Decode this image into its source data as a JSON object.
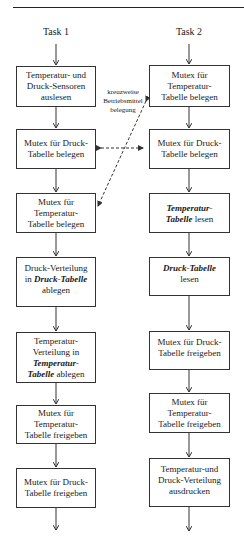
{
  "diagram": {
    "type": "flowchart",
    "columns": [
      {
        "title": "Task 1",
        "steps": [
          {
            "lines": [
              {
                "text": "Temperatur- und"
              },
              {
                "text": "Druck-Sensoren"
              },
              {
                "text": "auslesen"
              }
            ]
          },
          {
            "lines": [
              {
                "text": "Mutex für Druck-"
              },
              {
                "text": "Tabelle belegen"
              }
            ]
          },
          {
            "lines": [
              {
                "text": "Mutex für"
              },
              {
                "text": "Temperatur-"
              },
              {
                "text": "Tabelle belegen"
              }
            ]
          },
          {
            "lines": [
              {
                "text": "Druck-Verteilung"
              },
              {
                "pre": "in ",
                "em": "Druck-Tabelle"
              },
              {
                "text": "ablegen"
              }
            ]
          },
          {
            "lines": [
              {
                "text": "Temperatur-"
              },
              {
                "text": "Verteilung in"
              },
              {
                "em": "Temperatur-"
              },
              {
                "em": "Tabelle",
                "post": " ablegen"
              }
            ]
          },
          {
            "lines": [
              {
                "text": "Mutex für"
              },
              {
                "text": "Temperatur-"
              },
              {
                "text": "Tabelle freigeben"
              }
            ]
          },
          {
            "lines": [
              {
                "text": "Mutex für Druck-"
              },
              {
                "text": "Tabelle freigeben"
              }
            ]
          }
        ]
      },
      {
        "title": "Task 2",
        "steps": [
          {
            "lines": [
              {
                "text": "Mutex für"
              },
              {
                "text": "Temperatur-"
              },
              {
                "text": "Tabelle belegen"
              }
            ]
          },
          {
            "lines": [
              {
                "text": "Mutex für Druck-"
              },
              {
                "text": "Tabelle belegen"
              }
            ]
          },
          {
            "lines": [
              {
                "em": "Temperatur-"
              },
              {
                "em": "Tabelle",
                "post": " lesen"
              }
            ]
          },
          {
            "lines": [
              {
                "em": "Druck-Tabelle"
              },
              {
                "text": "lesen"
              }
            ]
          },
          {
            "lines": [
              {
                "text": "Mutex für Druck-"
              },
              {
                "text": "Tabelle freigeben"
              }
            ]
          },
          {
            "lines": [
              {
                "text": "Mutex für"
              },
              {
                "text": "Temperatur-"
              },
              {
                "text": "Tabelle freigeben"
              }
            ]
          },
          {
            "lines": [
              {
                "text": "Temperatur-und"
              },
              {
                "text": "Druck-Verteilung"
              },
              {
                "text": "ausdrucken"
              }
            ]
          }
        ]
      }
    ],
    "annotation": {
      "lines": [
        "kreuzweise",
        "Betriebsmittel",
        "belegung"
      ]
    },
    "colors": {
      "line": "#333333",
      "background": "#ffffff",
      "text": "#1a1a1a"
    }
  }
}
